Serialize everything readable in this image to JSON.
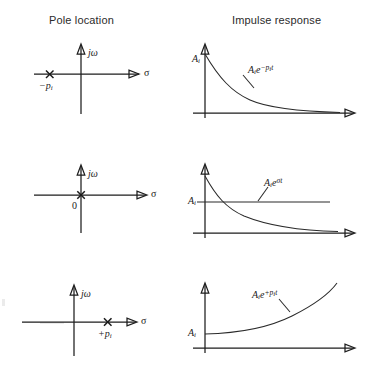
{
  "figure": {
    "title_columns": {
      "pole_location": "Pole location",
      "impulse_response": "Impulse response"
    },
    "axis_labels": {
      "imaginary": "jω",
      "real": "σ"
    },
    "rows": [
      {
        "id": "row-stable",
        "pole": {
          "marker": "x",
          "label": "−p",
          "label_sub": "i",
          "position": "left-half-plane",
          "sigma_value": "-p_i"
        },
        "response": {
          "amplitude_label": "A",
          "amplitude_sub": "i",
          "curve_label_base": "A",
          "curve_label_base_sub": "i",
          "curve_label_exp_e": "e",
          "curve_label_exp": "−p",
          "curve_label_exp_sub": "i",
          "curve_label_exp_t": "t",
          "expression": "A_i e^{-p_i t}",
          "behavior": "decaying-exponential"
        }
      },
      {
        "id": "row-marginal",
        "pole": {
          "marker": "x",
          "label": "0",
          "label_sub": "",
          "position": "origin",
          "sigma_value": "0"
        },
        "response": {
          "amplitude_label": "A",
          "amplitude_sub": "i",
          "curve_label_base": "A",
          "curve_label_base_sub": "i",
          "curve_label_exp_e": "e",
          "curve_label_exp": "σ",
          "curve_label_exp_sub": "",
          "curve_label_exp_t": "t",
          "expression": "A_i e^{σt}",
          "behavior": "constant"
        }
      },
      {
        "id": "row-unstable",
        "pole": {
          "marker": "x",
          "label": "+p",
          "label_sub": "i",
          "position": "right-half-plane",
          "sigma_value": "+p_i"
        },
        "response": {
          "amplitude_label": "A",
          "amplitude_sub": "i",
          "curve_label_base": "A",
          "curve_label_base_sub": "i",
          "curve_label_exp_e": "e",
          "curve_label_exp": "+p",
          "curve_label_exp_sub": "i",
          "curve_label_exp_t": "t",
          "expression": "A_i e^{+p_i t}",
          "behavior": "growing-exponential"
        }
      }
    ],
    "colors": {
      "ink": "#1d1d1d",
      "background": "#ffffff"
    }
  }
}
